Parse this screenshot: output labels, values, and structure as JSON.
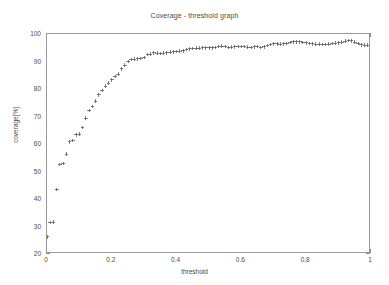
{
  "chart_data": {
    "type": "scatter",
    "title": "Coverage - threshold graph",
    "xlabel": "threshold",
    "ylabel": "coverage[%]",
    "xlim": [
      0,
      1
    ],
    "ylim": [
      20,
      100
    ],
    "grid": false,
    "legend": null,
    "marker": "+",
    "marker_color": "#555555",
    "axis_color": "#999999",
    "background_color": "#ffffff",
    "xticks": [
      0,
      0.2,
      0.4,
      0.6,
      0.8,
      1
    ],
    "xtick_labels": [
      "0",
      "0.2",
      "0.4",
      "0.6",
      "0.8",
      "1"
    ],
    "yticks": [
      20,
      30,
      40,
      50,
      60,
      70,
      80,
      90,
      100
    ],
    "ytick_labels": [
      "20",
      "30",
      "40",
      "50",
      "60",
      "70",
      "80",
      "90",
      "100"
    ],
    "series": [
      {
        "name": "coverage",
        "x": [
          0.0,
          0.01,
          0.02,
          0.03,
          0.04,
          0.05,
          0.06,
          0.07,
          0.08,
          0.09,
          0.1,
          0.11,
          0.12,
          0.13,
          0.14,
          0.15,
          0.16,
          0.17,
          0.18,
          0.19,
          0.2,
          0.21,
          0.22,
          0.23,
          0.24,
          0.25,
          0.26,
          0.27,
          0.28,
          0.29,
          0.3,
          0.31,
          0.32,
          0.33,
          0.34,
          0.35,
          0.36,
          0.37,
          0.38,
          0.39,
          0.4,
          0.41,
          0.42,
          0.43,
          0.44,
          0.45,
          0.46,
          0.47,
          0.48,
          0.49,
          0.5,
          0.51,
          0.52,
          0.53,
          0.54,
          0.55,
          0.56,
          0.57,
          0.58,
          0.59,
          0.6,
          0.61,
          0.62,
          0.63,
          0.64,
          0.65,
          0.66,
          0.67,
          0.68,
          0.69,
          0.7,
          0.71,
          0.72,
          0.73,
          0.74,
          0.75,
          0.76,
          0.77,
          0.78,
          0.79,
          0.8,
          0.81,
          0.82,
          0.83,
          0.84,
          0.85,
          0.86,
          0.87,
          0.88,
          0.89,
          0.9,
          0.91,
          0.92,
          0.93,
          0.94,
          0.95,
          0.96,
          0.97,
          0.98,
          0.99,
          1.0
        ],
        "y": [
          26.2,
          31.4,
          31.6,
          43.4,
          52.6,
          52.9,
          56.3,
          60.8,
          61.3,
          63.3,
          63.6,
          66.0,
          69.4,
          72.2,
          73.6,
          75.6,
          77.9,
          79.4,
          81.0,
          82.1,
          83.3,
          84.6,
          85.4,
          87.3,
          88.7,
          90.0,
          90.7,
          90.9,
          91.0,
          91.1,
          91.4,
          92.5,
          92.7,
          93.1,
          93.0,
          92.9,
          93.0,
          93.2,
          93.4,
          93.5,
          93.6,
          93.8,
          93.9,
          94.3,
          94.6,
          94.8,
          94.9,
          94.9,
          95.0,
          95.0,
          95.0,
          95.0,
          95.1,
          95.4,
          95.6,
          95.4,
          95.1,
          95.2,
          95.3,
          95.4,
          95.5,
          95.4,
          95.2,
          95.1,
          95.3,
          95.4,
          95.1,
          95.3,
          95.8,
          96.2,
          96.4,
          96.4,
          96.3,
          96.4,
          96.6,
          96.9,
          97.1,
          97.2,
          97.1,
          96.9,
          96.8,
          96.6,
          96.4,
          96.3,
          96.3,
          96.2,
          96.2,
          96.3,
          96.5,
          96.7,
          96.8,
          97.0,
          97.4,
          97.7,
          97.5,
          97.0,
          96.5,
          96.1,
          95.9,
          96.0,
          96.2
        ]
      }
    ]
  },
  "axes": {
    "title": "Coverage - threshold graph",
    "xlabel": "threshold",
    "ylabel": "coverage[%]"
  }
}
